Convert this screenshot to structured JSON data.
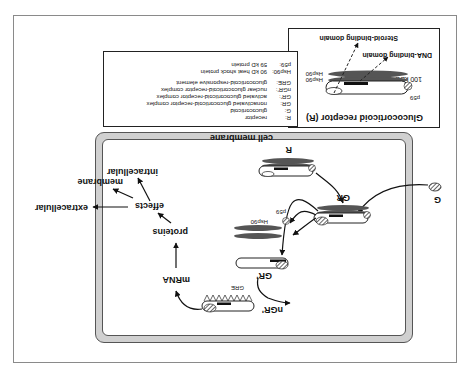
{
  "receptor_panel": {
    "title": "Glucocorticoid receptor (R)",
    "labels": {
      "hsp90_top": "Hsp90",
      "hsp90_bottom": "Hsp90",
      "p59": "p59",
      "size": "100 kDa",
      "dna_domain": "DNA-binding domain",
      "steroid_domain": "Steroid-binding domain"
    }
  },
  "legend": {
    "entries": [
      {
        "key": "R:",
        "value": "receptor"
      },
      {
        "key": "G:",
        "value": "glucocorticoid"
      },
      {
        "key": "GR:",
        "value": "nonactivated glucocorticoid-receptor complex"
      },
      {
        "key": "GR':",
        "value": "activated glucocorticoid-receptor complex"
      },
      {
        "key": "nGR':",
        "value": "nuclear glucocorticoid-receptor complex"
      },
      {
        "key": "GRE:",
        "value": "glucocorticoid-responsive element"
      },
      {
        "key": "Hsp90:",
        "value": "90 kD heat shock protein"
      },
      {
        "key": "p59:",
        "value": "59 kD protein"
      }
    ]
  },
  "cell": {
    "membrane_label": "cell membrane"
  },
  "pathway": {
    "G": "G",
    "R": "R",
    "GR": "GR",
    "hsp90": "Hsp90",
    "p59": "p59",
    "GR_prime": "GR'",
    "nGR_prime": "nGR'",
    "GRE": "GRE",
    "mRNA": "mRNA",
    "proteins": "proteins",
    "effects": "effects",
    "intracellular": "intracellular",
    "membrane": "membrane",
    "extracellular": "extracellular"
  },
  "colors": {
    "frame": "#8a8a8a",
    "membrane_fill": "#d0d0d0",
    "hsp_fill": "#555555",
    "ink": "#111111"
  },
  "orientation": "rotated 180 degrees"
}
